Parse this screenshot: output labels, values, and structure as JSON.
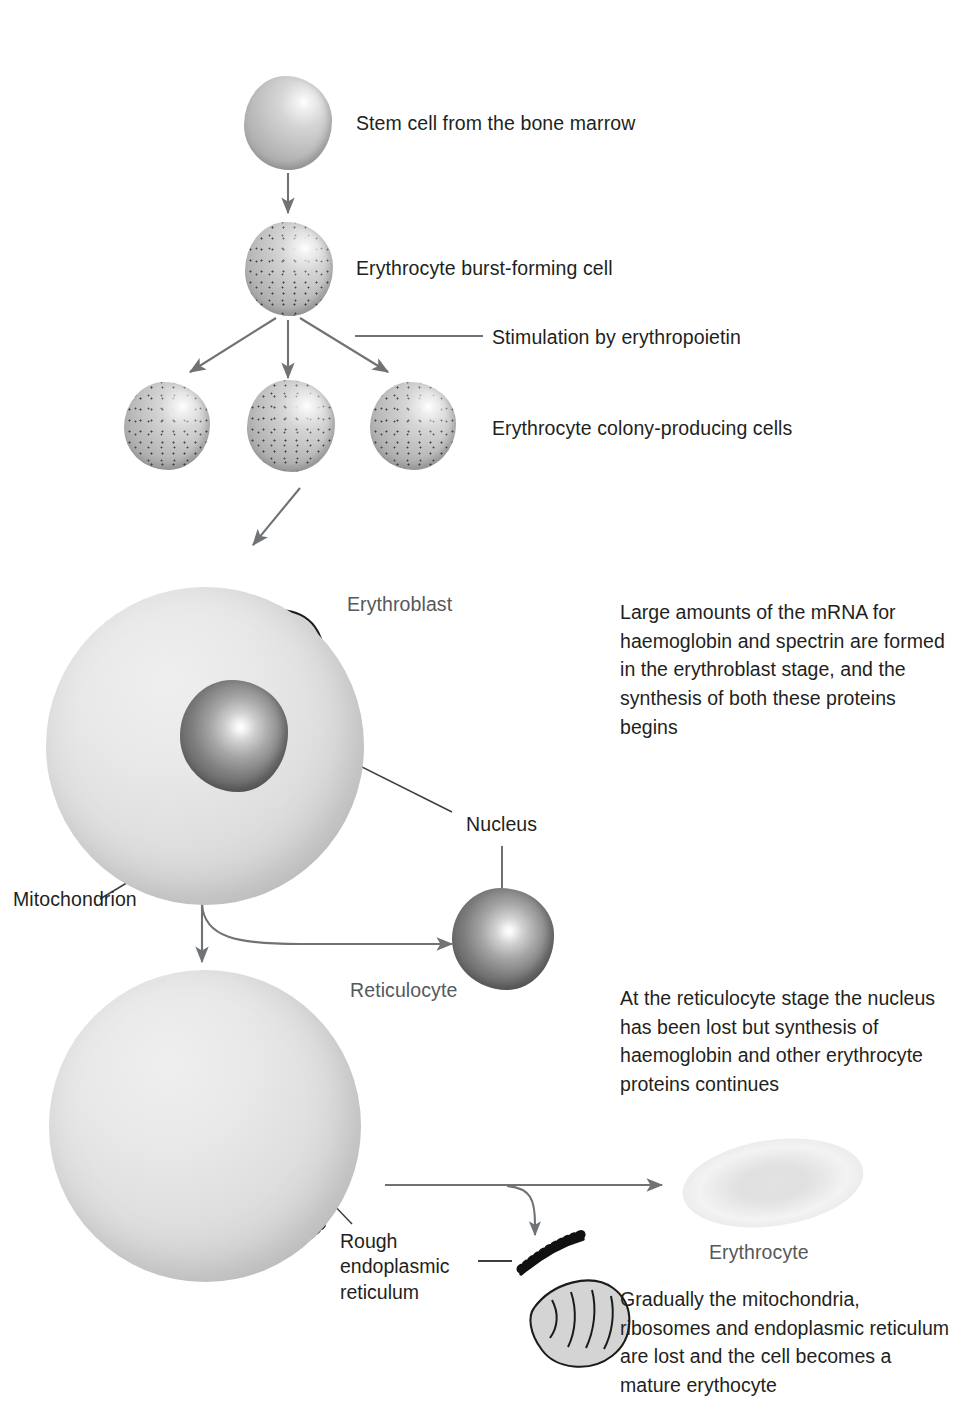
{
  "diagram": {
    "stages": [
      {
        "id": "stem-cell",
        "label": "Stem cell from the bone marrow"
      },
      {
        "id": "burst-forming",
        "label": "Erythrocyte burst-forming cell"
      },
      {
        "id": "colony-producing",
        "label": "Erythrocyte colony-producing cells"
      },
      {
        "id": "erythroblast",
        "label": "Erythroblast"
      },
      {
        "id": "reticulocyte",
        "label": "Reticulocyte"
      },
      {
        "id": "erythrocyte",
        "label": "Erythrocyte"
      }
    ],
    "annotations": {
      "stimulation": "Stimulation by erythropoietin",
      "nucleus": "Nucleus",
      "mitochondrion": "Mitochondrion",
      "rough_er": "Rough\nendoplasmic\nreticulum"
    },
    "notes": [
      {
        "id": "note-erythroblast",
        "text": "Large amounts of the mRNA for haemoglobin and spectrin are formed in the erythroblast stage, and the synthesis of both these proteins begins"
      },
      {
        "id": "note-reticulocyte",
        "text": "At the reticulocyte stage the nucleus has been lost but synthesis of haemoglobin and other erythrocyte proteins continues"
      },
      {
        "id": "note-erythrocyte",
        "text": "Gradually the mitochondria, ribosomes and endoplasmic reticulum are lost and the cell becomes a mature erythocyte"
      }
    ],
    "colors": {
      "text": "#231f20",
      "muted_text": "#55595c",
      "line": "#6f7376",
      "background": "#ffffff",
      "cell_fill": "#d9d9d9",
      "nucleus_fill": "#6b6b6b"
    }
  }
}
